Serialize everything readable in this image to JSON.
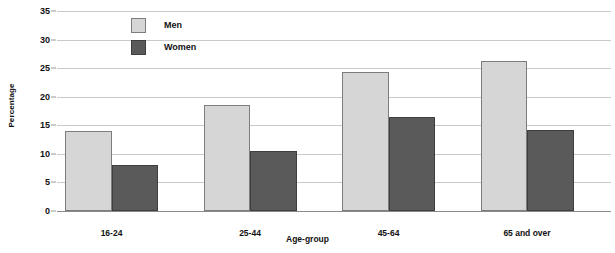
{
  "chart_data": {
    "type": "bar",
    "title": "",
    "xlabel": "Age-group",
    "ylabel": "Percentage",
    "categories": [
      "16-24",
      "25-44",
      "45-64",
      "65 and over"
    ],
    "series": [
      {
        "name": "Men",
        "values": [
          14.0,
          18.6,
          24.4,
          26.2
        ],
        "color": "#d6d6d6"
      },
      {
        "name": "Women",
        "values": [
          8.0,
          10.5,
          16.4,
          14.2
        ],
        "color": "#5a5a5a"
      }
    ],
    "ylim": [
      0,
      35
    ],
    "yticks": [
      0,
      5,
      10,
      15,
      20,
      25,
      30,
      35
    ],
    "ytick_labels": [
      "0",
      "5",
      "10",
      "15",
      "20",
      "25",
      "30",
      "35"
    ],
    "grid": true,
    "legend_position": "top-left-inside",
    "legend_entries": [
      "Men",
      "Women"
    ]
  },
  "axes": {
    "y_title": "Percentage",
    "x_title": "Age-group"
  },
  "legend": {
    "entries": [
      {
        "label": "Men"
      },
      {
        "label": "Women"
      }
    ]
  }
}
